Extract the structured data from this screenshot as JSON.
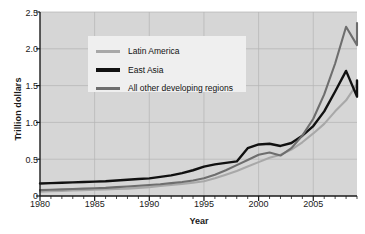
{
  "chart_data": {
    "type": "line",
    "title": "",
    "xlabel": "Year",
    "ylabel": "Trillion dollars",
    "xlim": [
      1980,
      2009
    ],
    "ylim": [
      0,
      2.5
    ],
    "grid": true,
    "legend_position": "upper-left-inside",
    "x_ticks": [
      "1980",
      "1985",
      "1990",
      "1995",
      "2000",
      "2005"
    ],
    "x_tick_values": [
      1980,
      1985,
      1990,
      1995,
      2000,
      2005
    ],
    "y_ticks": [
      "0",
      "0.5",
      "1.0",
      "1.5",
      "2.0",
      "2.5"
    ],
    "y_tick_values": [
      0,
      0.5,
      1.0,
      1.5,
      2.0,
      2.5
    ],
    "x": [
      1980,
      1981,
      1982,
      1983,
      1984,
      1985,
      1986,
      1987,
      1988,
      1989,
      1990,
      1991,
      1992,
      1993,
      1994,
      1995,
      1996,
      1997,
      1998,
      1999,
      2000,
      2001,
      2002,
      2003,
      2004,
      2005,
      2006,
      2007,
      2008,
      2009
    ],
    "series": [
      {
        "name": "Latin America",
        "color": "#a8a8a8",
        "values": [
          0.06,
          0.065,
          0.07,
          0.075,
          0.08,
          0.085,
          0.09,
          0.095,
          0.1,
          0.11,
          0.12,
          0.135,
          0.15,
          0.165,
          0.18,
          0.2,
          0.24,
          0.29,
          0.34,
          0.4,
          0.46,
          0.52,
          0.56,
          0.63,
          0.73,
          0.85,
          0.98,
          1.15,
          1.3,
          1.52
        ]
      },
      {
        "name": "East Asia",
        "color": "#111111",
        "values": [
          0.17,
          0.175,
          0.18,
          0.185,
          0.19,
          0.195,
          0.2,
          0.21,
          0.22,
          0.23,
          0.24,
          0.26,
          0.28,
          0.31,
          0.35,
          0.4,
          0.43,
          0.45,
          0.47,
          0.65,
          0.7,
          0.71,
          0.68,
          0.72,
          0.82,
          0.95,
          1.15,
          1.42,
          1.7,
          1.35
        ]
      },
      {
        "name": "All other developing regions",
        "color": "#6e6e6e",
        "values": [
          0.08,
          0.085,
          0.09,
          0.095,
          0.1,
          0.105,
          0.11,
          0.12,
          0.13,
          0.14,
          0.15,
          0.16,
          0.175,
          0.19,
          0.21,
          0.24,
          0.29,
          0.35,
          0.42,
          0.49,
          0.56,
          0.59,
          0.55,
          0.65,
          0.82,
          1.05,
          1.38,
          1.8,
          2.3,
          2.05
        ]
      }
    ],
    "series_extra_points": {
      "East Asia": {
        "2009": 1.57
      },
      "All other developing regions": {
        "2009": 2.35
      }
    }
  },
  "plot": {
    "background_color": "#d6d6d6",
    "gridline_color": "#b3b3b3",
    "axis_color": "#1a1a1a"
  }
}
